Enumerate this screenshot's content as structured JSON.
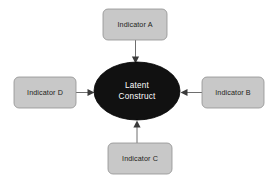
{
  "diagram": {
    "type": "latent-construct-indicator-model",
    "background_color": "#ffffff",
    "construct": {
      "label_line1": "Latent",
      "label_line2": "Construct",
      "shape": "ellipse",
      "fill_color": "#111111",
      "text_color": "#ffffff",
      "center_x": 137,
      "center_y": 91,
      "radius_x": 43,
      "radius_y": 29
    },
    "indicators": [
      {
        "id": "indicator-a",
        "label": "Indicator A",
        "position": "top",
        "x": 103,
        "y": 9,
        "width": 64,
        "height": 31,
        "fill_color": "#c8c8c8",
        "border_color": "#8f8f8f"
      },
      {
        "id": "indicator-b",
        "label": "Indicator B",
        "position": "right",
        "x": 202,
        "y": 77,
        "width": 62,
        "height": 31,
        "fill_color": "#c8c8c8",
        "border_color": "#8f8f8f"
      },
      {
        "id": "indicator-c",
        "label": "Indicator C",
        "position": "bottom",
        "x": 108,
        "y": 143,
        "width": 64,
        "height": 31,
        "fill_color": "#c8c8c8",
        "border_color": "#8f8f8f"
      },
      {
        "id": "indicator-d",
        "label": "Indicator D",
        "position": "left",
        "x": 14,
        "y": 77,
        "width": 62,
        "height": 31,
        "fill_color": "#c8c8c8",
        "border_color": "#8f8f8f"
      }
    ],
    "arrows": [
      {
        "id": "arrow-a-to-construct",
        "from": "indicator-a",
        "to": "construct",
        "direction": "down",
        "color": "#6e6e6e"
      },
      {
        "id": "arrow-b-to-construct",
        "from": "indicator-b",
        "to": "construct",
        "direction": "left",
        "color": "#6e6e6e"
      },
      {
        "id": "arrow-c-to-construct",
        "from": "indicator-c",
        "to": "construct",
        "direction": "up",
        "color": "#6e6e6e"
      },
      {
        "id": "arrow-d-to-construct",
        "from": "indicator-d",
        "to": "construct",
        "direction": "right",
        "color": "#6e6e6e"
      }
    ]
  }
}
